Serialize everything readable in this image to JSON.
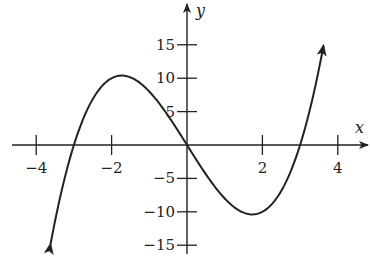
{
  "chart_data": {
    "type": "line",
    "title": "",
    "function": "y = x^3 - 9x",
    "xlabel": "x",
    "ylabel": "y",
    "xlim": [
      -4.7,
      4.7
    ],
    "ylim": [
      -15.5,
      21
    ],
    "x_ticks": [
      -4,
      -2,
      2,
      4
    ],
    "x_tick_labels": [
      "−4",
      "−2",
      "2",
      "4"
    ],
    "y_ticks": [
      15,
      10,
      5,
      -5,
      -10,
      -15
    ],
    "y_tick_labels": [
      "15",
      "10",
      "5",
      "−5",
      "−10",
      "−15"
    ],
    "grid": false,
    "legend": null,
    "series": [
      {
        "name": "f(x)",
        "domain": [
          -3.62,
          3.62
        ],
        "arrows": "both-ends",
        "x": [
          -3.62,
          -3.5,
          -3.0,
          -2.5,
          -2.0,
          -1.732,
          -1.5,
          -1.0,
          -0.5,
          0,
          0.5,
          1.0,
          1.5,
          1.732,
          2.0,
          2.5,
          3.0,
          3.5,
          3.62
        ],
        "y": [
          -14.86,
          -11.38,
          0,
          6.88,
          10,
          10.39,
          10.13,
          8,
          4.38,
          0,
          -4.38,
          -8,
          -10.13,
          -10.39,
          -10,
          -6.88,
          0,
          11.38,
          14.86
        ]
      }
    ],
    "key_points": {
      "local_max": [
        -1.73,
        10.39
      ],
      "local_min": [
        1.73,
        -10.39
      ],
      "roots": [
        -3,
        0,
        3
      ]
    }
  }
}
